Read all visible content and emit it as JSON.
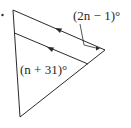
{
  "diagram": {
    "type": "geometry-triangle-parallel-lines",
    "bullet": "•",
    "labels": {
      "top_angle": "(2n − 1)°",
      "inner_angle": "(n + 31)°"
    },
    "colors": {
      "stroke": "#2a2a2a",
      "background": "#ffffff"
    }
  }
}
